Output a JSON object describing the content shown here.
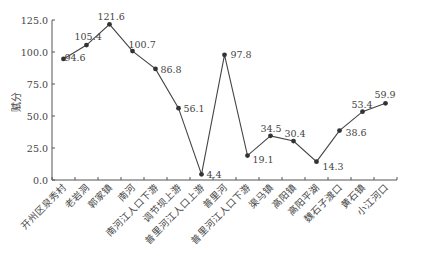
{
  "chart_data": {
    "type": "line",
    "title": "",
    "xlabel": "",
    "ylabel": "赋分",
    "ylim": [
      0,
      125
    ],
    "yticks": [
      "0.0",
      "25.0",
      "50.0",
      "75.0",
      "100.0",
      "125.0"
    ],
    "grid": false,
    "legend": null,
    "categories": [
      "开州区泉秀村",
      "老岩洞",
      "郭家镇",
      "南河",
      "南河江人口下游",
      "调节坝上游",
      "普里河江人口上游",
      "普里河",
      "普里河江人口下游",
      "渠马镇",
      "高阳镇",
      "高阳平湖",
      "魏石子渡口",
      "黄石镇",
      "小江河口"
    ],
    "series": [
      {
        "name": "赋分",
        "values": [
          94.6,
          105.4,
          121.6,
          100.7,
          86.8,
          56.1,
          4.4,
          97.8,
          19.1,
          34.5,
          30.4,
          14.3,
          38.6,
          53.4,
          59.9
        ]
      }
    ],
    "data_labels": [
      "94.6",
      "105.4",
      "121.6",
      "100.7",
      "86.8",
      "56.1",
      "4.4",
      "97.8",
      "19.1",
      "34.5",
      "30.4",
      "14.3",
      "38.6",
      "53.4",
      "59.9"
    ]
  }
}
